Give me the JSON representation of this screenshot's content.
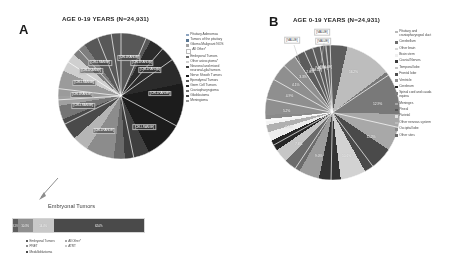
{
  "figure": {
    "panel_a": {
      "letter": "A",
      "title": "AGE 0-19 YEARS (N=24,931)",
      "legend": [
        {
          "label": "Pituitary Adenomas",
          "color": "#8ea5c0"
        },
        {
          "label": "Tumors of the pituitary",
          "color": "#5b7793"
        },
        {
          "label": "Glioma Malignant NOS",
          "color": "#a3a3a3"
        },
        {
          "label": "All Other*",
          "color": "#ffffff"
        },
        {
          "label": "Embryonal Tumors",
          "color": "#6e6e6e"
        },
        {
          "label": "Other astrocytoma*",
          "color": "#cfcfcf"
        },
        {
          "label": "Neuronal and mixed\nneuronal-glial tumors",
          "color": "#3c3c3c"
        },
        {
          "label": "Nerve Sheath Tumors",
          "color": "#1f1f1f"
        },
        {
          "label": "Ependymal Tumors",
          "color": "#5a5a5a"
        },
        {
          "label": "Germ Cell Tumors",
          "color": "#2d2d2d"
        },
        {
          "label": "Craniopharyngioma",
          "color": "#767676"
        },
        {
          "label": "Glioblastoma",
          "color": "#484848"
        },
        {
          "label": "Meningioma",
          "color": "#9b9b9b"
        }
      ],
      "callout": {
        "title": "Embryonal Tumors",
        "segments": [
          {
            "label": "Embryonal Tumors",
            "value": "3.1%",
            "color": "#5e5e5e"
          },
          {
            "label": "PNET",
            "value": "10.3%",
            "color": "#8f8f8f"
          },
          {
            "label": "ATRT",
            "value": "14.4%",
            "color": "#c8c8c8"
          },
          {
            "label": "Medulloblastoma",
            "value": "62.0%",
            "color": "#4a4a4a"
          }
        ],
        "legend_col1": [
          {
            "label": "Embryonal Tumors",
            "color": "#5e5e5e"
          },
          {
            "label": "PNET",
            "color": "#8f8f8f"
          },
          {
            "label": "Medulloblastoma",
            "color": "#4a4a4a"
          }
        ],
        "legend_col2": [
          {
            "label": "All Other*",
            "color": "#a8a8a8"
          },
          {
            "label": "ATRT",
            "color": "#c8c8c8"
          }
        ]
      }
    },
    "panel_b": {
      "letter": "B",
      "title": "AGE 0-19 YEARS (N=24,931)",
      "value_callouts": [
        "[VALUE]",
        "[VALUE]",
        "[VALUE]"
      ],
      "legend": [
        {
          "label": "Pituitary and\ncraniopharyngeal duct",
          "color": "#b9b9b9"
        },
        {
          "label": "Cerebellum",
          "color": "#6d6d6d"
        },
        {
          "label": "Other brain",
          "color": "#d8d8d8"
        },
        {
          "label": "Brain stem",
          "color": "#f0f0f0"
        },
        {
          "label": "Cranial Nerves",
          "color": "#3a3a3a"
        },
        {
          "label": "Temporal lobe",
          "color": "#c5c5c5"
        },
        {
          "label": "Frontal lobe",
          "color": "#4f4f4f"
        },
        {
          "label": "Ventricle",
          "color": "#909090"
        },
        {
          "label": "Cerebrum",
          "color": "#262626"
        },
        {
          "label": "Spinal cord and cauda\nequina",
          "color": "#7e7e7e"
        },
        {
          "label": "Meninges",
          "color": "#a5a5a5"
        },
        {
          "label": "Pineal",
          "color": "#575757"
        },
        {
          "label": "Parietal",
          "color": "#e2e2e2"
        },
        {
          "label": "Other nervous system",
          "color": "#bcbcbc"
        },
        {
          "label": "Occipital lobe",
          "color": "#8a8a8a"
        },
        {
          "label": "Other sites",
          "color": "#6a6a6a"
        }
      ]
    }
  },
  "chart_data": [
    {
      "type": "pie",
      "id": "panel-a-histology",
      "title": "AGE 0-19 YEARS (N=24,931)",
      "total_n": 24931,
      "label_format": "[CELLRANGE]",
      "legend_position": "right",
      "categories": [
        "Pituitary Adenomas",
        "Tumors of the pituitary",
        "Glioma Malignant NOS",
        "All Other*",
        "Embryonal Tumors",
        "Other astrocytoma*",
        "Neuronal and mixed neuronal-glial tumors",
        "Nerve Sheath Tumors",
        "Ependymal Tumors",
        "Germ Cell Tumors",
        "Craniopharyngioma",
        "Glioblastoma",
        "Meningioma"
      ],
      "values": [
        5.5,
        4.2,
        3.1,
        14.9,
        11.7,
        17.6,
        5.4,
        2.4,
        6.1,
        3.5,
        4.8,
        3.0,
        2.1
      ],
      "slice_labels": [
        "[CELLRANGE]",
        "[CELLRANGE]",
        "[CELLRANGE]",
        "[CELLRANGE]",
        "[CELLRANGE]",
        "[CELLRANGE]",
        "[CELLRANGE]",
        "[CELLRANGE]",
        "[CELLRANGE]",
        "[CELLRANGE]",
        "[CELLRANGE]"
      ]
    },
    {
      "type": "bar",
      "id": "embryonal-tumors-breakdown",
      "orientation": "stacked-horizontal",
      "title": "Embryonal Tumors",
      "categories": [
        "Embryonal Tumors",
        "PNET",
        "ATRT",
        "Medulloblastoma"
      ],
      "values": [
        3.1,
        10.3,
        14.4,
        62.0
      ],
      "value_labels": [
        "3.1%",
        "10.3%",
        "14.4%",
        "62.0%"
      ],
      "legend_entries": [
        "Embryonal Tumors",
        "PNET",
        "Medulloblastoma",
        "All Other*",
        "ATRT"
      ]
    },
    {
      "type": "pie",
      "id": "panel-b-site",
      "title": "AGE 0-19 YEARS (N=24,931)",
      "total_n": 24931,
      "legend_position": "right",
      "categories": [
        "Pituitary and craniopharyngeal duct",
        "Cerebellum",
        "Other brain",
        "Brain stem",
        "Cranial Nerves",
        "Temporal lobe",
        "Frontal lobe",
        "Ventricle",
        "Cerebrum",
        "Spinal cord and cauda equina",
        "Meninges",
        "Pineal",
        "Parietal",
        "Other nervous system",
        "Occipital lobe",
        "Other sites"
      ],
      "values": [
        16.2,
        12.9,
        11.2,
        10.6,
        9.0,
        7.6,
        6.1,
        5.2,
        4.9,
        4.1,
        3.3,
        2.6,
        2.1,
        1.8,
        1.4,
        1.0
      ],
      "value_labels": [
        "16.2%",
        "12.9%",
        "11.2%",
        "10.6%",
        "9.0%",
        "7.6%",
        "6.1%",
        "5.2%",
        "4.9%",
        "4.1%",
        "3.3%",
        "2.6%",
        "[VALUE]",
        "[VALUE]",
        "[VALUE]",
        ""
      ]
    }
  ]
}
